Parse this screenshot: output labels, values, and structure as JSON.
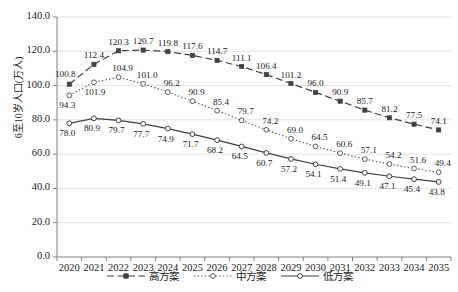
{
  "chart_data": {
    "type": "line",
    "title": "",
    "xlabel": "",
    "ylabel": "6至10岁人口(万人)",
    "categories": [
      "2020",
      "2021",
      "2022",
      "2023",
      "2024",
      "2025",
      "2026",
      "2027",
      "2028",
      "2029",
      "2030",
      "2031",
      "2032",
      "2033",
      "2034",
      "2035"
    ],
    "ylim": [
      0,
      140
    ],
    "yticks": [
      "0.0",
      "20.0",
      "40.0",
      "60.0",
      "80.0",
      "100.0",
      "120.0",
      "140.0"
    ],
    "grid": "horizontal",
    "legend_position": "bottom",
    "series": [
      {
        "name": "高方案",
        "style": "dashed",
        "marker": "filled-square",
        "color": "#404040",
        "values": [
          100.8,
          112.4,
          120.3,
          120.7,
          119.8,
          117.6,
          114.7,
          111.1,
          106.4,
          101.2,
          96.0,
          90.9,
          85.7,
          81.2,
          77.5,
          74.1
        ],
        "labels": [
          "100.8",
          "112.4",
          "120.3",
          "120.7",
          "119.8",
          "117.6",
          "114.7",
          "111.1",
          "106.4",
          "101.2",
          "96.0",
          "90.9",
          "85.7",
          "81.2",
          "77.5",
          "74.1"
        ]
      },
      {
        "name": "中方案",
        "style": "dotted",
        "marker": "open-circle",
        "color": "#595959",
        "values": [
          94.3,
          101.9,
          104.9,
          101.0,
          96.2,
          90.9,
          85.4,
          79.7,
          74.2,
          69.0,
          64.5,
          60.6,
          57.1,
          54.2,
          51.6,
          49.4
        ],
        "labels": [
          "94.3",
          "101.9",
          "104.9",
          "101.0",
          "96.2",
          "90.9",
          "85.4",
          "79.7",
          "74.2",
          "69.0",
          "64.5",
          "60.6",
          "57.1",
          "54.2",
          "51.6",
          "49.4"
        ]
      },
      {
        "name": "低方案",
        "style": "solid",
        "marker": "open-circle",
        "color": "#404040",
        "values": [
          78.0,
          80.9,
          79.7,
          77.7,
          74.9,
          71.7,
          68.2,
          64.5,
          60.7,
          57.2,
          54.1,
          51.4,
          49.1,
          47.1,
          45.4,
          43.8
        ],
        "labels": [
          "78.0",
          "80.9",
          "79.7",
          "77.7",
          "74.9",
          "71.7",
          "68.2",
          "64.5",
          "60.7",
          "57.2",
          "54.1",
          "51.4",
          "49.1",
          "47.1",
          "45.4",
          "43.8"
        ]
      }
    ],
    "colors": {
      "axis": "#7f7f7f",
      "grid": "#d9d9d9",
      "text": "#1a1a1a",
      "background": "#ffffff"
    }
  }
}
